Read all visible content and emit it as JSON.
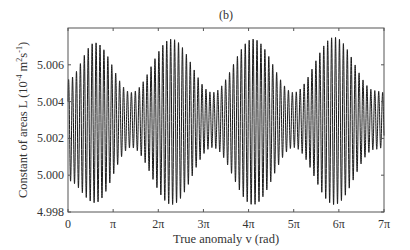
{
  "chart_data": {
    "type": "line",
    "title": "(b)",
    "xlabel": "True anomaly v (rad)",
    "ylabel": "Constant of areas L (10^-4 m^2 s^-1)",
    "ylabel_parts": {
      "main": "Constant of areas L (10",
      "exp1": "-4",
      "mid": " m",
      "exp2": "2",
      "mid2": "s",
      "exp3": "-1",
      "end": ")"
    },
    "xlim": [
      0,
      7
    ],
    "xlim_units": "pi",
    "ylim": [
      4.998,
      5.008
    ],
    "x_ticks": [
      0,
      1,
      2,
      3,
      4,
      5,
      6,
      7
    ],
    "x_tick_labels": [
      "0",
      "π",
      "2π",
      "3π",
      "4π",
      "5π",
      "6π",
      "7π"
    ],
    "y_ticks": [
      4.998,
      5.0,
      5.002,
      5.004,
      5.006
    ],
    "y_tick_labels": [
      "4.998",
      "5.000",
      "5.002",
      "5.004",
      "5.006"
    ],
    "grid": false,
    "legend": null,
    "series": [
      {
        "name": "L",
        "color": "#1a1a1a",
        "description": "Rapid oscillation (~11.5 cycles per pi) with slowly modulated amplitude envelope",
        "mean": 5.003,
        "fast_cycles_per_pi": 11.5,
        "envelope_period_pi": 1.78,
        "upper_envelope": {
          "x_pi": [
            0.0,
            0.6,
            1.4,
            2.3,
            3.2,
            4.1,
            5.0,
            5.9,
            6.8,
            7.0
          ],
          "y": [
            5.0052,
            5.0072,
            5.0045,
            5.0074,
            5.0045,
            5.0074,
            5.0045,
            5.0075,
            5.0046,
            5.0045
          ]
        },
        "lower_envelope": {
          "x_pi": [
            0.0,
            0.6,
            1.4,
            2.3,
            3.2,
            4.1,
            5.0,
            5.9,
            6.8,
            7.0
          ],
          "y": [
            4.9997,
            4.9985,
            5.0015,
            4.9984,
            5.0015,
            4.9984,
            5.0015,
            4.9984,
            5.0014,
            5.0015
          ]
        }
      }
    ]
  },
  "plot_frame": {
    "left": 68,
    "top": 28,
    "right": 384,
    "bottom": 212
  }
}
